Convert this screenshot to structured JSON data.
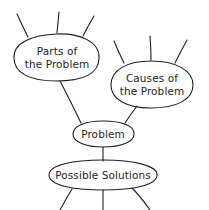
{
  "diagram": {
    "type": "concept-map",
    "stroke_color": "#1e1e1e",
    "background": "#ffffff",
    "nodes": [
      {
        "id": "parts",
        "label_line1": "Parts of",
        "label_line2": "the Problem"
      },
      {
        "id": "causes",
        "label_line1": "Causes of",
        "label_line2": "the Problem"
      },
      {
        "id": "problem",
        "label": "Problem"
      },
      {
        "id": "solutions",
        "label": "Possible Solutions"
      }
    ],
    "edges": [
      {
        "from": "parts",
        "to": "problem"
      },
      {
        "from": "causes",
        "to": "problem"
      },
      {
        "from": "problem",
        "to": "solutions"
      }
    ],
    "open_branches": {
      "parts": 3,
      "causes": 3,
      "solutions": 3
    }
  }
}
